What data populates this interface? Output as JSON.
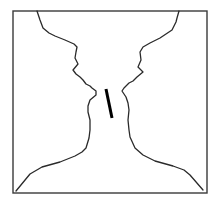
{
  "figure": {
    "title": "",
    "colors": {
      "background": "#ffffff",
      "frame": "#3a3a3a",
      "contour": "#2a2a2a",
      "bar": "#000000"
    },
    "frame": {
      "x": 13,
      "y": 11,
      "width": 194,
      "height": 182
    },
    "left_profile_points": "37,11 40,20 43,28 49,33 55,36 65,40 74,44 77,47 76,52 75,58 78,64 73,70 76,74 80,77 83,80 86,84 90,86 92,88 96,91 96,95 90,100 88,106 88,112 90,120 90,130 89,138 86,148 82,152 75,156 60,162 42,167 30,174 16,191",
    "right_profile_points": "179,11 177,18 176,22 172,30 160,38 150,43 143,47 140,52 141,60 138,67 143,72 137,77 133,81 129,83 124,88 122,91 126,97 128,103 129,110 128,120 129,130 130,137 135,148 143,155 155,161 173,166 184,170 190,175 203,190",
    "bar": {
      "x1": 106,
      "y1": 89,
      "x2": 112,
      "y2": 118
    }
  }
}
